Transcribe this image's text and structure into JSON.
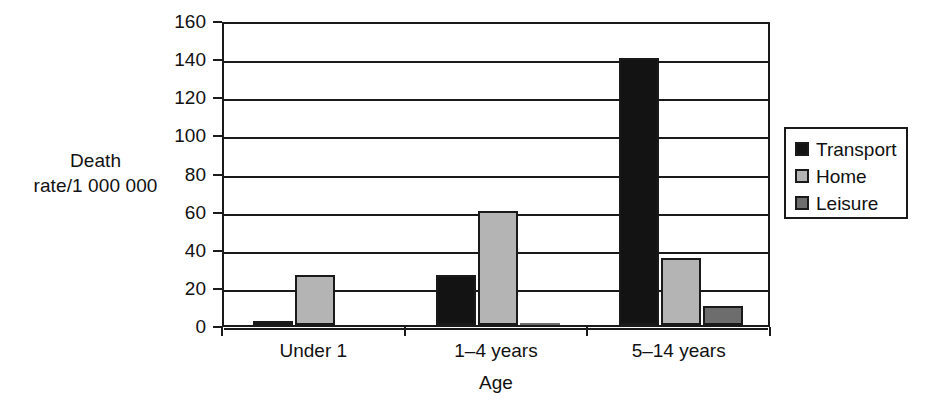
{
  "chart_data": {
    "type": "bar",
    "title": "",
    "xlabel": "Age",
    "ylabel": "Death\nrate/1 000 000",
    "ylabel_lines": [
      "Death",
      "rate/1 000 000"
    ],
    "categories": [
      "Under 1",
      "1–4 years",
      "5–14 years"
    ],
    "series": [
      {
        "name": "Transport",
        "color": "#131313",
        "values": [
          2,
          26,
          140
        ]
      },
      {
        "name": "Home",
        "color": "#b4b4b4",
        "values": [
          26,
          60,
          35
        ]
      },
      {
        "name": "Leisure",
        "color": "#6d6d6d",
        "values": [
          0,
          1,
          10
        ]
      }
    ],
    "ylim": [
      0,
      160
    ],
    "yticks": [
      0,
      20,
      40,
      60,
      80,
      100,
      120,
      140,
      160
    ],
    "ytick_labels": [
      "0",
      "20",
      "40",
      "60",
      "80",
      "100",
      "120",
      "140",
      "160"
    ],
    "grid": true,
    "grid_axis": "y",
    "legend_position": "right",
    "plot_border": true
  },
  "colors": {
    "axis": "#1a1a1a",
    "background": "#ffffff",
    "transport": "#131313",
    "home": "#b4b4b4",
    "leisure": "#6d6d6d"
  }
}
